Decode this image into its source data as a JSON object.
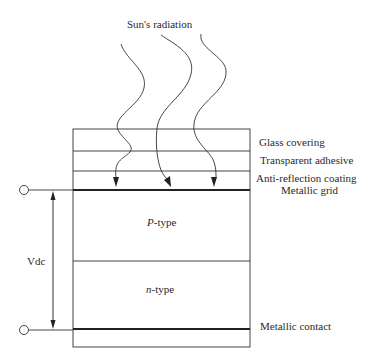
{
  "diagram": {
    "title_label": "Sun's radiation",
    "layers": [
      {
        "id": "glass",
        "label": "Glass covering"
      },
      {
        "id": "adhesive",
        "label": "Transparent adhesive"
      },
      {
        "id": "anti_reflection",
        "label": "Anti-reflection coating"
      },
      {
        "id": "grid",
        "label": "Metallic grid"
      }
    ],
    "regions": {
      "p_prefix": "P",
      "p_suffix": "-type",
      "n_prefix": "n",
      "n_suffix": "-type"
    },
    "contact_label": "Metallic contact",
    "voltage_label": "Vdc",
    "colors": {
      "line": "#333333",
      "background": "#ffffff"
    }
  }
}
